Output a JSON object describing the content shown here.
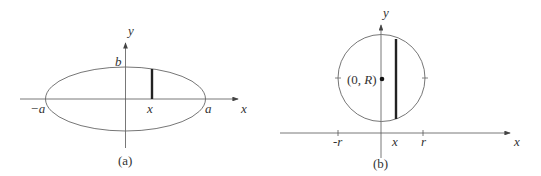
{
  "figure_a": {
    "caption": "(a)",
    "y_label": "y",
    "x_label": "x",
    "top_label": "b",
    "neg_label": "−a",
    "pos_label": "a",
    "slice_label": "x"
  },
  "figure_b": {
    "caption": "(b)",
    "y_label": "y",
    "x_label": "x",
    "center_label": "(0, R)",
    "neg_label": "-r",
    "pos_label": "r",
    "slice_label": "x"
  }
}
